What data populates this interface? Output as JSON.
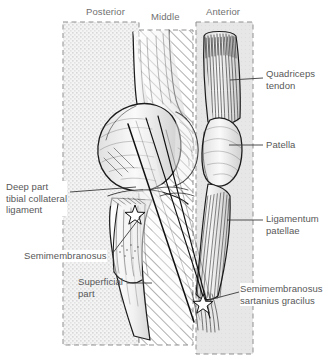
{
  "figure": {
    "type": "anatomical-illustration",
    "colors": {
      "text": "#585858",
      "zone_label_text": "#6f6f6f",
      "zone_border": "#8c8c8c",
      "posterior_fill": "#eeeeee",
      "middle_fill": "#ffffff",
      "anterior_fill": "#e6e6e6",
      "ink": "#1a1a1a",
      "leader": "#3a3a3a"
    }
  },
  "zones": [
    {
      "id": "posterior",
      "label": "Posterior",
      "pattern": "stipple",
      "label_x": 86,
      "label_y": 6,
      "x": 63,
      "y": 22,
      "w": 76,
      "h": 323
    },
    {
      "id": "middle",
      "label": "Middle",
      "pattern": "diagonal-hatch",
      "label_x": 151,
      "label_y": 11,
      "x": 139,
      "y": 30,
      "w": 54,
      "h": 315
    },
    {
      "id": "anterior",
      "label": "Anterior",
      "pattern": "solid-gray",
      "label_x": 206,
      "label_y": 6,
      "x": 196,
      "y": 22,
      "w": 57,
      "h": 332
    }
  ],
  "annotations": [
    {
      "id": "quadriceps-tendon",
      "text": "Quadriceps\ntendon",
      "side": "right",
      "x": 266,
      "y": 68,
      "leader": [
        [
          230,
          80
        ],
        [
          262,
          78
        ]
      ],
      "target": [
        230,
        80
      ]
    },
    {
      "id": "patella",
      "text": "Patella",
      "side": "right",
      "x": 266,
      "y": 141,
      "leader": [
        [
          231,
          145
        ],
        [
          262,
          145
        ]
      ],
      "target": [
        231,
        145
      ]
    },
    {
      "id": "ligamentum-patellae",
      "text": "Ligamentum\npatellae",
      "side": "right",
      "x": 266,
      "y": 213,
      "leader": [
        [
          228,
          220
        ],
        [
          262,
          220
        ]
      ],
      "target": [
        228,
        220
      ]
    },
    {
      "id": "semimembranosus-sartanius-gracilus",
      "text": "Semimembranosus\nsartanius gracilus",
      "side": "right",
      "x": 240,
      "y": 283,
      "leader": [
        [
          204,
          302
        ],
        [
          238,
          292
        ]
      ],
      "target": [
        204,
        302
      ]
    },
    {
      "id": "deep-part-tibial-collateral-ligament",
      "text": "Deep part\ntibial collateral\nligament",
      "side": "left",
      "x": 6,
      "y": 182,
      "leader": [
        [
          70,
          192
        ],
        [
          134,
          188
        ]
      ],
      "target": [
        134,
        188
      ]
    },
    {
      "id": "semimembranosus",
      "text": "Semimembranosus",
      "side": "left",
      "x": 24,
      "y": 255,
      "leader": [
        [
          112,
          256
        ],
        [
          140,
          216
        ]
      ],
      "target": [
        140,
        216
      ]
    },
    {
      "id": "superficial-part",
      "text": "Superficial\npart",
      "side": "left",
      "x": 78,
      "y": 278,
      "leader": [
        [
          128,
          283
        ],
        [
          152,
          283
        ]
      ],
      "target": [
        152,
        283
      ]
    }
  ],
  "markers": [
    {
      "id": "star-marker-upper",
      "x": 135,
      "y": 213
    },
    {
      "id": "star-marker-lower",
      "x": 203,
      "y": 302
    }
  ],
  "structures": [
    {
      "id": "femur-shaft",
      "name": "Femur shaft"
    },
    {
      "id": "femoral-condyle",
      "name": "Femoral condyle"
    },
    {
      "id": "patella-bone",
      "name": "Patella"
    },
    {
      "id": "quadriceps-tendon-fibers",
      "name": "Quadriceps tendon"
    },
    {
      "id": "ligamentum-patellae-fibers",
      "name": "Ligamentum patellae"
    },
    {
      "id": "tibia",
      "name": "Tibia"
    },
    {
      "id": "tibial-collateral-ligament",
      "name": "Tibial collateral ligament"
    },
    {
      "id": "semimembranosus-insertion",
      "name": "Semimembranosus insertion"
    }
  ]
}
